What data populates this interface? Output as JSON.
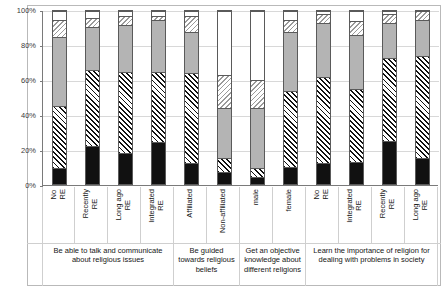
{
  "chart_data": {
    "type": "bar",
    "variant": "stacked-100-percent",
    "title": "",
    "subtitle": "",
    "xlabel": "",
    "ylabel": "",
    "ylim": [
      0,
      100
    ],
    "ytick_labels": [
      "0%",
      "20%",
      "40%",
      "60%",
      "80%",
      "100%"
    ],
    "ytick_values": [
      0,
      20,
      40,
      60,
      80,
      100
    ],
    "grid": true,
    "legend_position": "none",
    "series": [
      {
        "name": "series-1-black",
        "pattern": "solid-black",
        "color": "#111111"
      },
      {
        "name": "series-2-hatch-right",
        "pattern": "diagonal-hatch",
        "color": "#111111"
      },
      {
        "name": "series-3-gray",
        "pattern": "solid-gray",
        "color": "#b4b4b4"
      },
      {
        "name": "series-4-hatch-left",
        "pattern": "diagonal-hatch-light",
        "color": "#9a9a9a"
      },
      {
        "name": "series-5-white",
        "pattern": "solid-white",
        "color": "#ffffff"
      }
    ],
    "categories": [
      "No RE",
      "Recently RE",
      "Long ago RE",
      "Integrated RE",
      "Affiliated",
      "Non-affiliated",
      "male",
      "female",
      "No RE",
      "Integrated RE",
      "Recently RE",
      "Long ago RE"
    ],
    "bars": [
      {
        "category": "No RE",
        "group": 0,
        "values": [
          9,
          36,
          40,
          10,
          5
        ]
      },
      {
        "category": "Recently RE",
        "group": 0,
        "values": [
          22,
          44,
          25,
          5,
          4
        ]
      },
      {
        "category": "Long ago RE",
        "group": 0,
        "values": [
          18,
          47,
          27,
          5,
          3
        ]
      },
      {
        "category": "Integrated RE",
        "group": 0,
        "values": [
          24,
          41,
          30,
          2,
          3
        ]
      },
      {
        "category": "Affiliated",
        "group": 1,
        "values": [
          12,
          52,
          24,
          9,
          3
        ]
      },
      {
        "category": "Non-affiliated",
        "group": 1,
        "values": [
          7,
          8,
          29,
          19,
          37
        ]
      },
      {
        "category": "male",
        "group": 2,
        "values": [
          4,
          5,
          35,
          16,
          40
        ]
      },
      {
        "category": "female",
        "group": 2,
        "values": [
          10,
          44,
          34,
          7,
          5
        ]
      },
      {
        "category": "No RE",
        "group": 3,
        "values": [
          12,
          50,
          31,
          5,
          2
        ]
      },
      {
        "category": "Integrated RE",
        "group": 3,
        "values": [
          13,
          42,
          31,
          8,
          6
        ]
      },
      {
        "category": "Recently RE",
        "group": 3,
        "values": [
          25,
          48,
          20,
          5,
          2
        ]
      },
      {
        "category": "Long ago RE",
        "group": 3,
        "values": [
          15,
          59,
          21,
          5,
          0
        ]
      }
    ],
    "groups": [
      {
        "label": "Be able to talk and communicate about religious issues",
        "bar_count": 4
      },
      {
        "label": "Be guided towards religious beliefs",
        "bar_count": 2
      },
      {
        "label": "Get an objective knowledge about different religions",
        "bar_count": 2
      },
      {
        "label": "Learn the importance of religion for dealing with problems in society",
        "bar_count": 4
      }
    ]
  }
}
